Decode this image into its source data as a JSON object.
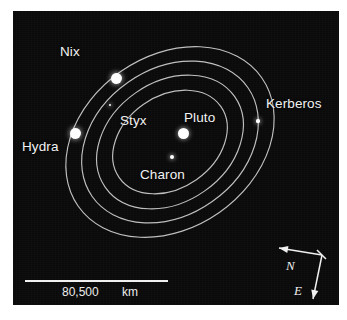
{
  "figure": {
    "type": "astronomical-orbit-diagram",
    "background_color": "#0a0a0a",
    "line_color": "#cfcfcf",
    "label_color": "#f2f2f2"
  },
  "bodies": [
    {
      "name": "Pluto",
      "label": "Pluto",
      "kind": "planet",
      "x": 183,
      "y": 133,
      "size": 11
    },
    {
      "name": "Charon",
      "label": "Charon",
      "kind": "moon",
      "x": 172,
      "y": 157,
      "size": 4.5
    },
    {
      "name": "Styx",
      "label": "Styx",
      "kind": "moon",
      "x": 110,
      "y": 105,
      "size": 2.6
    },
    {
      "name": "Nix",
      "label": "Nix",
      "kind": "moon",
      "x": 116,
      "y": 78,
      "size": 11
    },
    {
      "name": "Kerberos",
      "label": "Kerberos",
      "kind": "moon",
      "x": 258,
      "y": 121,
      "size": 3.2
    },
    {
      "name": "Hydra",
      "label": "Hydra",
      "kind": "moon",
      "x": 75,
      "y": 133,
      "size": 11
    }
  ],
  "labels": [
    {
      "text": "Nix",
      "x": 60,
      "y": 44
    },
    {
      "text": "Hydra",
      "x": 22,
      "y": 139
    },
    {
      "text": "Styx",
      "x": 120,
      "y": 113
    },
    {
      "text": "Pluto",
      "x": 184,
      "y": 110
    },
    {
      "text": "Kerberos",
      "x": 266,
      "y": 96
    },
    {
      "text": "Charon",
      "x": 140,
      "y": 167
    }
  ],
  "orbits": [
    {
      "name": "charon-styx-orbit",
      "rx": 62,
      "ry": 46,
      "rotation": -35
    },
    {
      "name": "nix-orbit",
      "rx": 79,
      "ry": 60,
      "rotation": -35
    },
    {
      "name": "kerberos-orbit",
      "rx": 95,
      "ry": 73,
      "rotation": -35
    },
    {
      "name": "hydra-orbit",
      "rx": 112,
      "ry": 86,
      "rotation": -35
    }
  ],
  "orbit_center": {
    "x": 170,
    "y": 142
  },
  "scale": {
    "value": "80,500",
    "unit": "km",
    "bar_start_x": 25,
    "bar_end_x": 168,
    "bar_y": 280
  },
  "compass": {
    "north_label": "N",
    "east_label": "E",
    "vertex": {
      "x": 322,
      "y": 255
    },
    "north_tip": {
      "x": 279,
      "y": 248
    },
    "east_tip": {
      "x": 313,
      "y": 299
    }
  }
}
